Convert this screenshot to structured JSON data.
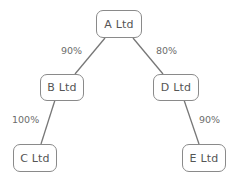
{
  "diagram": {
    "type": "ownership-tree",
    "line_color": "#777777",
    "nodes": [
      {
        "id": "A",
        "label": "A Ltd"
      },
      {
        "id": "B",
        "label": "B Ltd"
      },
      {
        "id": "C",
        "label": "C Ltd"
      },
      {
        "id": "D",
        "label": "D Ltd"
      },
      {
        "id": "E",
        "label": "E Ltd"
      }
    ],
    "edges": [
      {
        "from": "A",
        "to": "B",
        "label": "90%"
      },
      {
        "from": "A",
        "to": "D",
        "label": "80%"
      },
      {
        "from": "B",
        "to": "C",
        "label": "100%"
      },
      {
        "from": "D",
        "to": "E",
        "label": "90%"
      }
    ]
  }
}
